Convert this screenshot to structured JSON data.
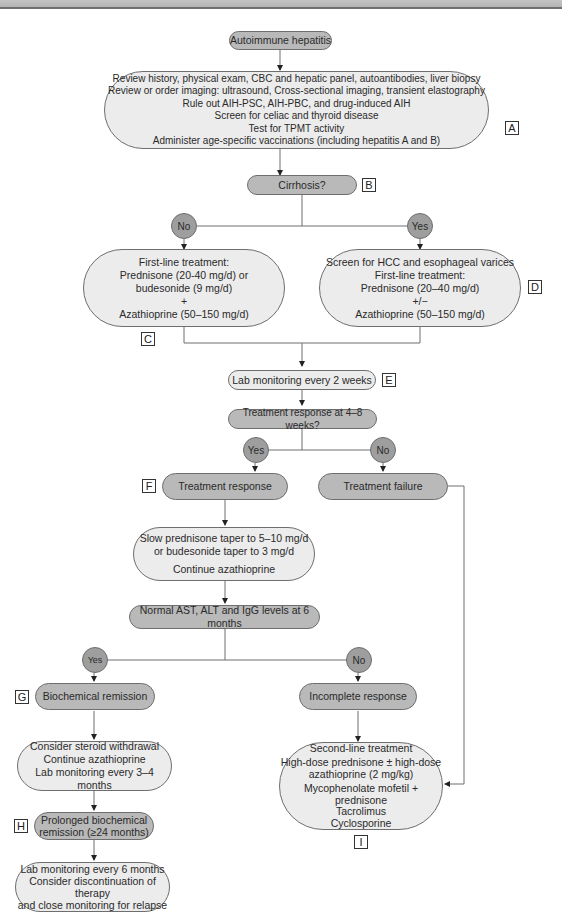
{
  "title": "Autoimmune hepatitis",
  "nodes": {
    "start": "Autoimmune hepatitis",
    "workup": [
      "Review history, physical exam, CBC and hepatic panel, autoantibodies, liver biopsy",
      "Review or order imaging: ultrasound, Cross-sectional imaging, transient elastography",
      "Rule out AIH-PSC, AIH-PBC, and drug-induced AIH",
      "Screen for celiac and thyroid disease",
      "Test for TPMT activity",
      "Administer age-specific vaccinations (including hepatitis A and B)"
    ],
    "cirrhosis": "Cirrhosis?",
    "no_cirrhosis_tx": [
      "First-line treatment:",
      "Prednisone (20-40 mg/d) or",
      "budesonide (9 mg/d)",
      "+",
      "Azathioprine (50–150 mg/d)"
    ],
    "cirrhosis_tx": [
      "Screen for HCC and esophageal varices",
      "First-line treatment:",
      "Prednisone (20–40 mg/d)",
      "+/−",
      "Azathioprine (50–150 mg/d)"
    ],
    "lab_2wk": "Lab monitoring every 2 weeks",
    "response_q": "Treatment response at 4–8 weeks?",
    "tx_response": "Treatment response",
    "tx_failure": "Treatment failure",
    "taper": [
      "Slow prednisone taper to 5–10 mg/d",
      "or budesonide taper to 3 mg/d",
      "Continue azathioprine"
    ],
    "normal_labs_q": "Normal AST, ALT and IgG levels at 6 months",
    "biochem_remission": "Biochemical remission",
    "incomplete": "Incomplete response",
    "steroid_withdrawal": [
      "Consider steroid withdrawal",
      "Continue azathioprine",
      "Lab monitoring every 3–4 months"
    ],
    "prolonged": [
      "Prolonged biochemical",
      "remission (≥24 months)"
    ],
    "final": [
      "Lab monitoring every 6 months",
      "Consider discontinuation of therapy",
      "and close monitoring for relapse"
    ],
    "second_line": [
      "Second-line treatment",
      "High-dose prednisone ± high-dose",
      "azathioprine (2 mg/kg)",
      "Mycophenolate mofetil + prednisone",
      "Tacrolimus",
      "Cyclosporine"
    ]
  },
  "decisions": {
    "cirrhosis_no": "No",
    "cirrhosis_yes": "Yes",
    "response_yes": "Yes",
    "response_no": "No",
    "labs_yes": "Yes",
    "labs_no": "No"
  },
  "tags": {
    "A": "A",
    "B": "B",
    "C": "C",
    "D": "D",
    "E": "E",
    "F": "F",
    "G": "G",
    "H": "H",
    "I": "I"
  },
  "colors": {
    "dark_node": "#b9b9b9",
    "light_node": "#ececec",
    "decision_circle": "#9e9e9e",
    "line": "#6e6e6e"
  }
}
